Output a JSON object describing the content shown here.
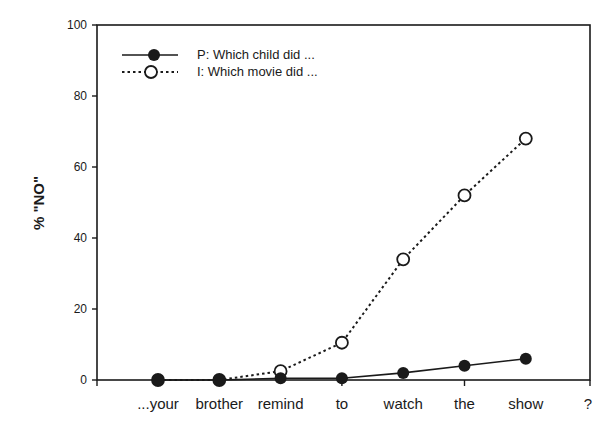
{
  "chart_data": {
    "type": "line",
    "title": "",
    "xlabel": "",
    "ylabel": "% \"NO\"",
    "ylim": [
      0,
      100
    ],
    "yticks": [
      0,
      20,
      40,
      60,
      80,
      100
    ],
    "grid": false,
    "legend_position": "upper-left",
    "categories": [
      "...your",
      "brother",
      "remind",
      "to",
      "watch",
      "the",
      "show",
      "?"
    ],
    "series": [
      {
        "name": "P:  Which child did ...",
        "marker": "filled-circle",
        "line": "solid",
        "values": [
          0,
          0,
          0.5,
          0.5,
          2,
          4,
          6,
          null
        ]
      },
      {
        "name": "I:  Which movie did ...",
        "marker": "open-circle",
        "line": "dotted",
        "values": [
          0,
          0,
          2.5,
          10.5,
          34,
          52,
          68,
          null
        ]
      }
    ]
  },
  "colors": {
    "ink": "#1a1a1a",
    "background": "#ffffff"
  }
}
